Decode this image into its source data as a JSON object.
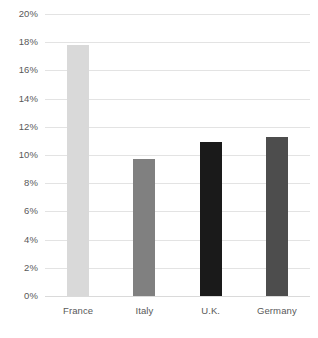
{
  "chart_data": {
    "type": "bar",
    "title": "",
    "subtitle": "",
    "xlabel": "",
    "ylabel": "",
    "categories": [
      "France",
      "Italy",
      "U.K.",
      "Germany"
    ],
    "values": [
      17.8,
      9.7,
      10.9,
      11.3
    ],
    "value_format": "percent",
    "ylim": [
      0,
      20
    ],
    "ytick_step": 2,
    "ytick_labels": [
      "0%",
      "2%",
      "4%",
      "6%",
      "8%",
      "10%",
      "12%",
      "14%",
      "16%",
      "18%",
      "20%"
    ],
    "ytick_values": [
      0,
      2,
      4,
      6,
      8,
      10,
      12,
      14,
      16,
      18,
      20
    ],
    "bar_colors": [
      "#d9d9d9",
      "#808080",
      "#1a1a1a",
      "#4d4d4d"
    ],
    "grid": true,
    "grid_axis": "y",
    "grid_color": "#e3e3e3",
    "legend": false,
    "legend_position": "none",
    "background_color": "#ffffff",
    "axis_label_color": "#595959"
  }
}
